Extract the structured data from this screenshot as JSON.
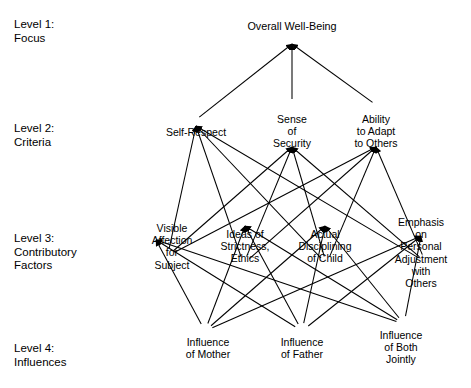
{
  "diagram": {
    "type": "hierarchy-tree",
    "background_color": "#ffffff",
    "line_color": "#000000",
    "text_color": "#000000",
    "levels": [
      {
        "id": "level1",
        "label": "Level 1:\nFocus"
      },
      {
        "id": "level2",
        "label": "Level 2:\nCriteria"
      },
      {
        "id": "level3",
        "label": "Level 3:\nContributory\nFactors"
      },
      {
        "id": "level4",
        "label": "Level 4:\nInfluences"
      }
    ],
    "nodes": {
      "focus": [
        {
          "id": "overall-well-being",
          "label": "Overall Well-Being",
          "x": 292,
          "y": 30
        }
      ],
      "criteria": [
        {
          "id": "self-respect",
          "label": "Self-Respect",
          "x": 196,
          "y": 136
        },
        {
          "id": "sense-of-security",
          "label": "Sense\nof\nSecurity",
          "x": 292,
          "y": 123
        },
        {
          "id": "ability-to-adapt",
          "label": "Ability\nto Adapt\nto Others",
          "x": 376,
          "y": 123
        }
      ],
      "contributory_factors": [
        {
          "id": "visible-affection",
          "label": "Visible\nAffection\nfor\nSubject",
          "x": 172,
          "y": 230
        },
        {
          "id": "ideas-of-strictness",
          "label": "Ideas of\nStrictness,\nEthics",
          "x": 245,
          "y": 236
        },
        {
          "id": "actual-disciplining",
          "label": "Actual\nDisciplining\nof Child",
          "x": 325,
          "y": 236
        },
        {
          "id": "emphasis-on-personal-adjustment",
          "label": "Emphasis\non\nPersonal\nAdjustment\nwith Others",
          "x": 421,
          "y": 224
        }
      ],
      "influences": [
        {
          "id": "influence-of-mother",
          "label": "Influence\nof Mother",
          "x": 208,
          "y": 343
        },
        {
          "id": "influence-of-father",
          "label": "Influence\nof Father",
          "x": 302,
          "y": 343
        },
        {
          "id": "influence-of-both-jointly",
          "label": "Influence\nof Both\nJointly",
          "x": 401,
          "y": 336
        }
      ]
    },
    "edges": [
      {
        "from": "self-respect",
        "to": "overall-well-being"
      },
      {
        "from": "sense-of-security",
        "to": "overall-well-being"
      },
      {
        "from": "ability-to-adapt",
        "to": "overall-well-being"
      },
      {
        "from": "visible-affection",
        "to": "self-respect"
      },
      {
        "from": "ideas-of-strictness",
        "to": "self-respect"
      },
      {
        "from": "actual-disciplining",
        "to": "self-respect"
      },
      {
        "from": "emphasis-on-personal-adjustment",
        "to": "self-respect"
      },
      {
        "from": "visible-affection",
        "to": "sense-of-security"
      },
      {
        "from": "ideas-of-strictness",
        "to": "sense-of-security"
      },
      {
        "from": "actual-disciplining",
        "to": "sense-of-security"
      },
      {
        "from": "emphasis-on-personal-adjustment",
        "to": "sense-of-security"
      },
      {
        "from": "visible-affection",
        "to": "ability-to-adapt"
      },
      {
        "from": "ideas-of-strictness",
        "to": "ability-to-adapt"
      },
      {
        "from": "actual-disciplining",
        "to": "ability-to-adapt"
      },
      {
        "from": "emphasis-on-personal-adjustment",
        "to": "ability-to-adapt"
      },
      {
        "from": "influence-of-mother",
        "to": "visible-affection"
      },
      {
        "from": "influence-of-father",
        "to": "visible-affection"
      },
      {
        "from": "influence-of-both-jointly",
        "to": "visible-affection"
      },
      {
        "from": "influence-of-mother",
        "to": "ideas-of-strictness"
      },
      {
        "from": "influence-of-father",
        "to": "ideas-of-strictness"
      },
      {
        "from": "influence-of-both-jointly",
        "to": "ideas-of-strictness"
      },
      {
        "from": "influence-of-mother",
        "to": "actual-disciplining"
      },
      {
        "from": "influence-of-father",
        "to": "actual-disciplining"
      },
      {
        "from": "influence-of-both-jointly",
        "to": "actual-disciplining"
      },
      {
        "from": "influence-of-mother",
        "to": "emphasis-on-personal-adjustment"
      },
      {
        "from": "influence-of-father",
        "to": "emphasis-on-personal-adjustment"
      },
      {
        "from": "influence-of-both-jointly",
        "to": "emphasis-on-personal-adjustment"
      }
    ]
  }
}
